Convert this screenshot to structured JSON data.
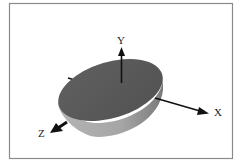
{
  "figure": {
    "colors": {
      "border": "#8a8a8a",
      "top_face": "#5b5b5b",
      "side_wall": "#a9a9a9",
      "side_wall_shadow": "#8d8d8d",
      "axis": "#111111",
      "label": "#222222",
      "background": "#ffffff"
    },
    "axes": {
      "x": {
        "label": "X"
      },
      "y": {
        "label": "Y"
      },
      "z": {
        "label": "Z"
      }
    }
  }
}
